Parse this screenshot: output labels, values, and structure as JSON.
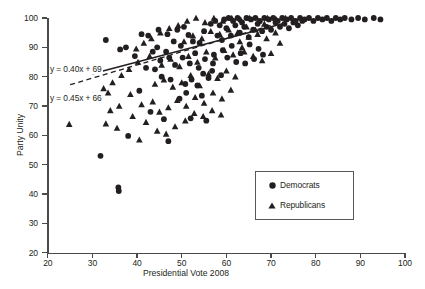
{
  "chart_data": {
    "type": "scatter",
    "title": "",
    "xlabel": "Presidential Vote 2008",
    "ylabel": "Party Unity",
    "xlim": [
      20,
      100
    ],
    "ylim": [
      20,
      100
    ],
    "xticks": [
      20,
      30,
      40,
      50,
      60,
      70,
      80,
      90,
      100
    ],
    "yticks": [
      20,
      30,
      40,
      50,
      60,
      70,
      80,
      90,
      100
    ],
    "grid": false,
    "legend_position": "center-right",
    "annotations": [
      {
        "text": "y = 0.40x + 69",
        "series": "Democrats",
        "line_style": "solid"
      },
      {
        "text": "y = 0.45x + 66",
        "series": "Republicans",
        "line_style": "dashed"
      }
    ],
    "trendlines": [
      {
        "name": "Democrats",
        "slope": 0.4,
        "intercept": 69,
        "style": "solid",
        "x_start": 30,
        "x_end": 73
      },
      {
        "name": "Republicans",
        "slope": 0.45,
        "intercept": 66,
        "style": "dashed",
        "x_start": 25,
        "x_end": 70
      }
    ],
    "series": [
      {
        "name": "Democrats",
        "marker": "circle",
        "color": "#231f20",
        "points": [
          [
            31.8,
            53.0
          ],
          [
            35.8,
            42.2
          ],
          [
            35.9,
            41.0
          ],
          [
            38.0,
            59.8
          ],
          [
            47.0,
            58.0
          ],
          [
            33.0,
            92.5
          ],
          [
            36.2,
            89.3
          ],
          [
            41.0,
            94.5
          ],
          [
            44.5,
            90.0
          ],
          [
            46.5,
            88.5
          ],
          [
            49.0,
            96.0
          ],
          [
            50.5,
            97.0
          ],
          [
            51.5,
            94.2
          ],
          [
            52.5,
            92.0
          ],
          [
            40.5,
            75.2
          ],
          [
            42.0,
            83.0
          ],
          [
            44.0,
            82.5
          ],
          [
            45.5,
            80.0
          ],
          [
            47.5,
            79.0
          ],
          [
            48.5,
            84.0
          ],
          [
            43.0,
            68.0
          ],
          [
            46.0,
            65.5
          ],
          [
            52.0,
            65.8
          ],
          [
            55.5,
            65.0
          ],
          [
            49.5,
            72.5
          ],
          [
            51.0,
            74.5
          ],
          [
            53.5,
            77.0
          ],
          [
            54.5,
            73.5
          ],
          [
            56.0,
            79.5
          ],
          [
            57.0,
            84.5
          ],
          [
            53.0,
            88.0
          ],
          [
            54.0,
            91.5
          ],
          [
            55.0,
            95.5
          ],
          [
            56.5,
            98.0
          ],
          [
            57.5,
            99.0
          ],
          [
            58.5,
            97.5
          ],
          [
            59.5,
            99.5
          ],
          [
            60.5,
            100.0
          ],
          [
            61.5,
            99.0
          ],
          [
            62.5,
            100.0
          ],
          [
            63.5,
            98.5
          ],
          [
            64.5,
            100.0
          ],
          [
            65.5,
            99.5
          ],
          [
            66.5,
            100.0
          ],
          [
            67.5,
            99.0
          ],
          [
            68.5,
            100.0
          ],
          [
            69.5,
            99.5
          ],
          [
            70.5,
            100.0
          ],
          [
            71.5,
            99.0
          ],
          [
            72.5,
            100.0
          ],
          [
            73.5,
            99.5
          ],
          [
            74.5,
            100.0
          ],
          [
            75.5,
            99.0
          ],
          [
            76.5,
            100.0
          ],
          [
            77.5,
            99.5
          ],
          [
            78.5,
            100.0
          ],
          [
            79.5,
            99.0
          ],
          [
            80.5,
            100.0
          ],
          [
            81.5,
            99.5
          ],
          [
            82.5,
            100.0
          ],
          [
            83.5,
            99.0
          ],
          [
            84.5,
            100.0
          ],
          [
            85.5,
            99.5
          ],
          [
            86.5,
            100.0
          ],
          [
            88.0,
            99.5
          ],
          [
            89.5,
            100.0
          ],
          [
            91.0,
            99.5
          ],
          [
            93.0,
            100.0
          ],
          [
            94.5,
            99.5
          ],
          [
            58.0,
            94.0
          ],
          [
            59.0,
            92.5
          ],
          [
            60.0,
            96.5
          ],
          [
            61.0,
            94.0
          ],
          [
            62.0,
            97.5
          ],
          [
            63.0,
            95.0
          ],
          [
            64.0,
            97.0
          ],
          [
            65.0,
            93.5
          ],
          [
            66.0,
            96.0
          ],
          [
            67.0,
            98.0
          ],
          [
            68.0,
            95.5
          ],
          [
            69.0,
            97.0
          ],
          [
            70.0,
            96.0
          ],
          [
            71.0,
            98.5
          ],
          [
            72.0,
            97.0
          ],
          [
            73.0,
            98.0
          ],
          [
            74.0,
            96.5
          ],
          [
            75.0,
            98.5
          ],
          [
            76.0,
            97.5
          ],
          [
            77.0,
            99.0
          ],
          [
            55.2,
            86.0
          ],
          [
            57.2,
            87.5
          ],
          [
            59.2,
            89.0
          ],
          [
            61.2,
            90.5
          ],
          [
            63.2,
            88.0
          ],
          [
            65.2,
            91.0
          ],
          [
            67.2,
            89.5
          ],
          [
            50.2,
            86.5
          ],
          [
            51.8,
            84.5
          ],
          [
            53.8,
            83.0
          ],
          [
            48.2,
            92.0
          ],
          [
            49.8,
            90.5
          ],
          [
            45.2,
            85.5
          ],
          [
            47.2,
            86.5
          ],
          [
            43.5,
            88.5
          ],
          [
            54.8,
            81.0
          ],
          [
            56.8,
            82.0
          ],
          [
            58.8,
            80.5
          ],
          [
            52.2,
            79.0
          ],
          [
            50.8,
            77.5
          ],
          [
            60.2,
            86.5
          ],
          [
            62.2,
            85.0
          ],
          [
            64.2,
            84.5
          ],
          [
            66.2,
            86.0
          ],
          [
            68.2,
            87.5
          ],
          [
            42.5,
            94.0
          ],
          [
            44.8,
            96.0
          ],
          [
            46.8,
            94.5
          ],
          [
            39.5,
            87.0
          ],
          [
            37.5,
            90.0
          ]
        ]
      },
      {
        "name": "Republicans",
        "marker": "triangle",
        "color": "#231f20",
        "points": [
          [
            24.8,
            63.8
          ],
          [
            30.0,
            73.5
          ],
          [
            33.5,
            74.5
          ],
          [
            38.5,
            74.0
          ],
          [
            41.0,
            70.5
          ],
          [
            43.5,
            71.5
          ],
          [
            45.0,
            68.0
          ],
          [
            47.0,
            69.5
          ],
          [
            49.0,
            72.0
          ],
          [
            51.0,
            70.0
          ],
          [
            53.0,
            73.0
          ],
          [
            55.0,
            71.0
          ],
          [
            57.0,
            74.5
          ],
          [
            59.0,
            72.5
          ],
          [
            61.0,
            75.5
          ],
          [
            44.0,
            77.5
          ],
          [
            46.0,
            79.0
          ],
          [
            48.0,
            76.5
          ],
          [
            50.0,
            78.0
          ],
          [
            52.0,
            80.5
          ],
          [
            54.0,
            77.0
          ],
          [
            56.0,
            81.0
          ],
          [
            58.0,
            79.5
          ],
          [
            60.0,
            82.0
          ],
          [
            62.0,
            80.0
          ],
          [
            45.5,
            84.0
          ],
          [
            47.5,
            86.0
          ],
          [
            49.5,
            83.5
          ],
          [
            51.5,
            87.0
          ],
          [
            53.5,
            85.0
          ],
          [
            55.5,
            88.5
          ],
          [
            57.5,
            86.5
          ],
          [
            59.5,
            89.0
          ],
          [
            61.5,
            87.5
          ],
          [
            63.5,
            90.0
          ],
          [
            50.5,
            92.0
          ],
          [
            52.5,
            94.0
          ],
          [
            54.5,
            93.0
          ],
          [
            56.5,
            95.5
          ],
          [
            58.5,
            94.5
          ],
          [
            60.5,
            96.0
          ],
          [
            62.5,
            95.0
          ],
          [
            64.5,
            97.0
          ],
          [
            66.5,
            96.0
          ],
          [
            68.5,
            98.0
          ],
          [
            51.2,
            99.0
          ],
          [
            53.2,
            100.0
          ],
          [
            55.2,
            98.5
          ],
          [
            57.2,
            100.0
          ],
          [
            59.2,
            99.0
          ],
          [
            61.2,
            100.0
          ],
          [
            63.2,
            99.5
          ],
          [
            65.2,
            100.0
          ],
          [
            67.2,
            99.0
          ],
          [
            69.2,
            100.0
          ],
          [
            71.2,
            99.5
          ],
          [
            73.2,
            100.0
          ],
          [
            75.2,
            99.0
          ],
          [
            49.2,
            97.5
          ],
          [
            47.2,
            96.5
          ],
          [
            45.2,
            95.0
          ],
          [
            43.2,
            93.0
          ],
          [
            41.5,
            91.5
          ],
          [
            39.8,
            89.5
          ],
          [
            42.8,
            87.0
          ],
          [
            40.2,
            85.0
          ],
          [
            38.2,
            82.5
          ],
          [
            36.5,
            80.5
          ],
          [
            34.5,
            78.0
          ],
          [
            32.5,
            76.0
          ],
          [
            63.0,
            92.0
          ],
          [
            65.0,
            93.5
          ],
          [
            67.0,
            94.5
          ],
          [
            69.0,
            93.0
          ],
          [
            71.0,
            95.0
          ],
          [
            64.0,
            88.5
          ],
          [
            66.0,
            87.0
          ],
          [
            68.0,
            85.5
          ],
          [
            70.0,
            88.0
          ],
          [
            72.0,
            91.5
          ],
          [
            36.0,
            70.0
          ],
          [
            34.0,
            68.5
          ],
          [
            39.0,
            66.5
          ],
          [
            42.0,
            64.5
          ],
          [
            48.5,
            63.0
          ],
          [
            33.0,
            64.0
          ],
          [
            35.5,
            62.5
          ],
          [
            44.5,
            61.5
          ],
          [
            46.5,
            60.5
          ],
          [
            40.5,
            58.5
          ],
          [
            52.8,
            67.5
          ],
          [
            54.8,
            66.5
          ],
          [
            50.8,
            65.0
          ],
          [
            56.8,
            68.5
          ],
          [
            58.8,
            67.0
          ]
        ]
      }
    ]
  },
  "axes": {
    "y_title": "Party Unity",
    "x_title": "Presidential Vote 2008",
    "y_tick_labels": [
      "100",
      "90",
      "80",
      "70",
      "60",
      "50",
      "40",
      "30",
      "20"
    ],
    "x_tick_labels": [
      "20",
      "30",
      "40",
      "50",
      "60",
      "70",
      "80",
      "90",
      "100"
    ]
  },
  "equations": {
    "democrats": "y = 0.40x + 69",
    "republicans": "y = 0.45x + 66"
  },
  "legend": {
    "items": [
      {
        "label": "Democrats",
        "marker": "circle"
      },
      {
        "label": "Republicans",
        "marker": "triangle"
      }
    ]
  }
}
